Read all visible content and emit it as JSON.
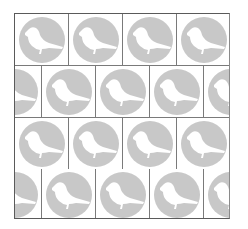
{
  "pattern": {
    "name": "bird-tile-pattern",
    "rows": 4,
    "columns_per_row": 4,
    "row_offset_alternate_px": -27,
    "colors": {
      "background": "#ffffff",
      "circle": "#c8c8c8",
      "bird": "#ffffff",
      "grid_line": "#7a7a7a",
      "frame_line": "#5a5a5a"
    },
    "tile_icon": "bird-in-circle-icon"
  }
}
